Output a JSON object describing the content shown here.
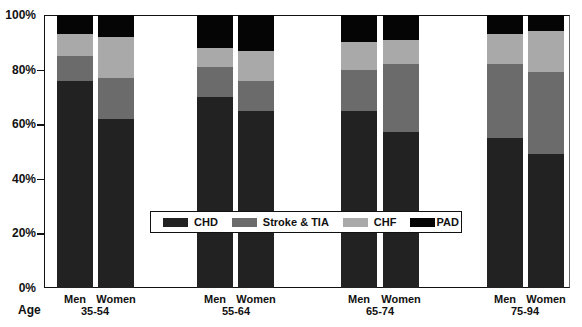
{
  "chart_data": {
    "type": "bar",
    "stacked": true,
    "normalized_percent": true,
    "title": "",
    "xlabel": "Age",
    "ylabel": "",
    "ylim": [
      0,
      100
    ],
    "yticks": [
      "0%",
      "20%",
      "40%",
      "60%",
      "80%",
      "100%"
    ],
    "grid": false,
    "legend_position": "inside-lower-center",
    "groups": [
      {
        "age": "35-54",
        "bars": [
          {
            "sex": "Men",
            "values": {
              "CHD": 76,
              "Stroke & TIA": 9,
              "CHF": 8,
              "PAD": 7
            }
          },
          {
            "sex": "Women",
            "values": {
              "CHD": 62,
              "Stroke & TIA": 15,
              "CHF": 15,
              "PAD": 8
            }
          }
        ]
      },
      {
        "age": "55-64",
        "bars": [
          {
            "sex": "Men",
            "values": {
              "CHD": 70,
              "Stroke & TIA": 11,
              "CHF": 7,
              "PAD": 12
            }
          },
          {
            "sex": "Women",
            "values": {
              "CHD": 65,
              "Stroke & TIA": 11,
              "CHF": 11,
              "PAD": 13
            }
          }
        ]
      },
      {
        "age": "65-74",
        "bars": [
          {
            "sex": "Men",
            "values": {
              "CHD": 65,
              "Stroke & TIA": 15,
              "CHF": 10,
              "PAD": 10
            }
          },
          {
            "sex": "Women",
            "values": {
              "CHD": 57,
              "Stroke & TIA": 25,
              "CHF": 9,
              "PAD": 9
            }
          }
        ]
      },
      {
        "age": "75-94",
        "bars": [
          {
            "sex": "Men",
            "values": {
              "CHD": 55,
              "Stroke & TIA": 27,
              "CHF": 11,
              "PAD": 7
            }
          },
          {
            "sex": "Women",
            "values": {
              "CHD": 49,
              "Stroke & TIA": 30,
              "CHF": 15,
              "PAD": 6
            }
          }
        ]
      }
    ],
    "categories": [
      "Men 35-54",
      "Women 35-54",
      "Men 55-64",
      "Women 55-64",
      "Men 65-74",
      "Women 65-74",
      "Men 75-94",
      "Women 75-94"
    ],
    "series": [
      {
        "name": "CHD",
        "color": "#222222",
        "values": [
          76,
          62,
          70,
          65,
          65,
          57,
          55,
          49
        ]
      },
      {
        "name": "Stroke & TIA",
        "color": "#6b6b6b",
        "values": [
          9,
          15,
          11,
          11,
          15,
          25,
          27,
          30
        ]
      },
      {
        "name": "CHF",
        "color": "#a9a9a9",
        "values": [
          8,
          15,
          7,
          11,
          10,
          9,
          11,
          15
        ]
      },
      {
        "name": "PAD",
        "color": "#050505",
        "values": [
          7,
          8,
          12,
          13,
          10,
          9,
          7,
          6
        ]
      }
    ]
  },
  "axis": {
    "age_title": "Age",
    "yticks": [
      {
        "label": "0%",
        "value": 0
      },
      {
        "label": "20%",
        "value": 20
      },
      {
        "label": "40%",
        "value": 40
      },
      {
        "label": "60%",
        "value": 60
      },
      {
        "label": "80%",
        "value": 80
      },
      {
        "label": "100%",
        "value": 100
      }
    ]
  },
  "legend": {
    "items": [
      {
        "label": "CHD",
        "color": "#222222"
      },
      {
        "label": "Stroke & TIA",
        "color": "#6b6b6b"
      },
      {
        "label": "CHF",
        "color": "#a9a9a9"
      },
      {
        "label": "PAD",
        "color": "#050505"
      }
    ]
  },
  "layout": {
    "bar_x": [
      57,
      98,
      197,
      238,
      341,
      383,
      487,
      528
    ],
    "group_centers": [
      95,
      236,
      380,
      525
    ]
  }
}
